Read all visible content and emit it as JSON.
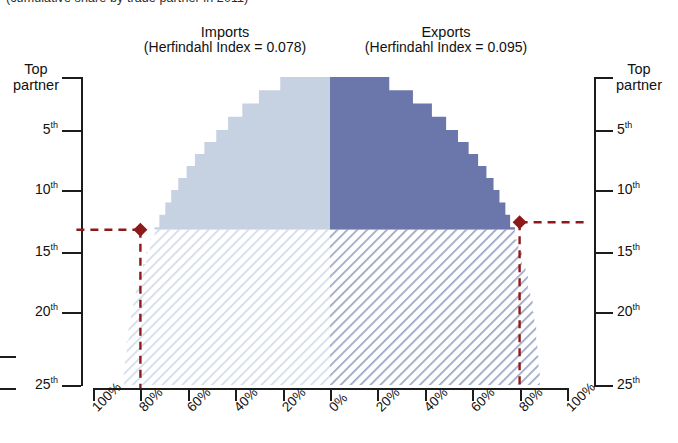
{
  "caption": {
    "text": "(cumulative share by trade partner in 2011)"
  },
  "panels": {
    "imports": {
      "title": "Imports",
      "subtitle": "(Herfindahl Index = 0.078)",
      "herfindahl_index": 0.078,
      "fill_color": "#c6d2e2",
      "hatch_color": "#ccd7e6"
    },
    "exports": {
      "title": "Exports",
      "subtitle": "(Herfindahl Index = 0.095)",
      "herfindahl_index": 0.095,
      "fill_color": "#6b77ab",
      "hatch_color": "#8a95bb"
    }
  },
  "axes": {
    "left_title": "Top\npartner",
    "left_title_line1": "Top",
    "left_title_line2": "partner",
    "right_title_line1": "Top",
    "right_title_line2": "partner",
    "y_ticks": [
      {
        "label": "Top partner",
        "rank": 1,
        "suffix": "",
        "y": 77
      },
      {
        "label": "5",
        "rank": 5,
        "suffix": "th",
        "y": 130
      },
      {
        "label": "10",
        "rank": 10,
        "suffix": "th",
        "y": 190
      },
      {
        "label": "15",
        "rank": 15,
        "suffix": "th",
        "y": 252
      },
      {
        "label": "20",
        "rank": 20,
        "suffix": "th",
        "y": 312
      },
      {
        "label": "25",
        "rank": 25,
        "suffix": "th",
        "y": 385
      }
    ],
    "x_ticks": [
      "100%",
      "80%",
      "60%",
      "40%",
      "20%",
      "0%",
      "20%",
      "40%",
      "60%",
      "80%",
      "100%"
    ]
  },
  "markers": {
    "color": "#8c1a1a",
    "shape": "diamond",
    "imports_marker": {
      "x_pct": 80,
      "rank": 13.2,
      "side": "imports"
    },
    "exports_marker": {
      "x_pct": 80,
      "rank": 12.6,
      "side": "exports"
    }
  },
  "chart_data": {
    "type": "area",
    "title": "Cumulative share by trade partner",
    "subtitle": "(cumulative share by trade partner in 2011)",
    "xlabel": "",
    "ylabel": "Trade partner rank",
    "orientation": "horizontal-mirrored",
    "grid": false,
    "legend": "none",
    "xlim": [
      -100,
      100
    ],
    "ylim": [
      1,
      25
    ],
    "x_tick_values": [
      -100,
      -80,
      -60,
      -40,
      -20,
      0,
      20,
      40,
      60,
      80,
      100
    ],
    "x_tick_labels": [
      "100%",
      "80%",
      "60%",
      "40%",
      "20%",
      "0%",
      "20%",
      "40%",
      "60%",
      "80%",
      "100%"
    ],
    "y_tick_values": [
      1,
      5,
      10,
      15,
      20,
      25
    ],
    "y_tick_labels": [
      "Top partner",
      "5th",
      "10th",
      "15th",
      "20th",
      "25th"
    ],
    "annotation_rank_threshold": 13,
    "annotation_share_threshold_pct": 80,
    "series": [
      {
        "name": "Imports",
        "direction": "left",
        "color": "#c6d2e2",
        "ranks": [
          1,
          2,
          3,
          4,
          5,
          6,
          7,
          8,
          9,
          10,
          11,
          12,
          13,
          14,
          15,
          16,
          17,
          18,
          19,
          20,
          21,
          22,
          23,
          24,
          25
        ],
        "cumulative_share_pct": [
          21,
          30,
          37,
          43,
          48,
          53,
          57,
          60.5,
          64,
          67,
          69.5,
          72,
          74,
          76,
          77.5,
          79,
          80.5,
          82,
          83,
          84,
          85,
          85.8,
          86.5,
          87,
          87.5
        ]
      },
      {
        "name": "Exports",
        "direction": "right",
        "color": "#6b77ab",
        "ranks": [
          1,
          2,
          3,
          4,
          5,
          6,
          7,
          8,
          9,
          10,
          11,
          12,
          13,
          14,
          15,
          16,
          17,
          18,
          19,
          20,
          21,
          22,
          23,
          24,
          25
        ],
        "cumulative_share_pct": [
          25,
          35,
          43,
          49,
          54,
          58.5,
          62.5,
          66,
          69,
          71.5,
          74,
          76,
          78,
          79.5,
          81,
          82.5,
          83.5,
          84.5,
          85.5,
          86.2,
          87,
          87.5,
          88,
          88.5,
          89
        ]
      }
    ]
  }
}
